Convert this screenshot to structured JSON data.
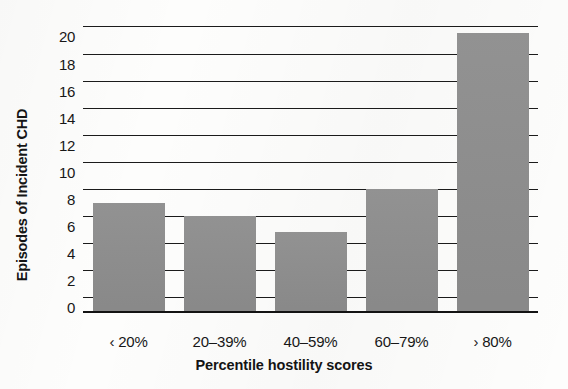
{
  "chart_data": {
    "type": "bar",
    "title": "",
    "xlabel": "Percentile hostility scores",
    "ylabel": "Episodes of Incident CHD",
    "categories": [
      "‹ 20%",
      "20–39%",
      "40–59%",
      "60–79%",
      "› 80%"
    ],
    "values": [
      8,
      7,
      5.8,
      9,
      20.5
    ],
    "ylim": [
      0,
      21
    ],
    "yticks": [
      0,
      2,
      4,
      6,
      8,
      10,
      12,
      14,
      16,
      18,
      20
    ],
    "ytick_labels": [
      "0",
      "2",
      "4",
      "6",
      "8",
      "10",
      "12",
      "14",
      "16",
      "18",
      "20"
    ],
    "gridlines": [
      1,
      3,
      5,
      7,
      9,
      11,
      13,
      15,
      17,
      19,
      21
    ],
    "grid": true,
    "legend": "none",
    "bar_color": "#8d8d8d",
    "axis_color": "#1b1b1b",
    "background": "#fdfdfc"
  }
}
